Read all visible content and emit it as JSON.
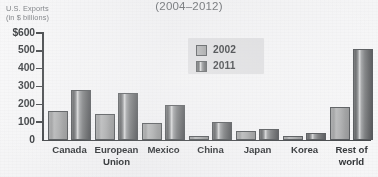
{
  "chart_data": {
    "type": "bar",
    "title": "(2004–2012)",
    "ylabel_line1": "U.S. Exports",
    "ylabel_line2": "(in $ billions)",
    "xlabel": "",
    "ylim": [
      0,
      600
    ],
    "yticks": [
      {
        "value": 600,
        "label": "$600"
      },
      {
        "value": 500,
        "label": "500"
      },
      {
        "value": 400,
        "label": "400"
      },
      {
        "value": 300,
        "label": "300"
      },
      {
        "value": 200,
        "label": "200"
      },
      {
        "value": 100,
        "label": "100"
      },
      {
        "value": 0,
        "label": "0"
      }
    ],
    "grid": false,
    "legend_position": "upper center",
    "categories": [
      "Canada",
      "European Union",
      "Mexico",
      "China",
      "Japan",
      "Korea",
      "Rest of world"
    ],
    "category_lines": [
      [
        "Canada"
      ],
      [
        "European",
        "Union"
      ],
      [
        "Mexico"
      ],
      [
        "China"
      ],
      [
        "Japan"
      ],
      [
        "Korea"
      ],
      [
        "Rest of",
        "world"
      ]
    ],
    "series": [
      {
        "name": "2002",
        "color": "#a6a7a8",
        "values": [
          160,
          145,
          97,
          20,
          50,
          20,
          183
        ]
      },
      {
        "name": "2011",
        "color": "#66686a",
        "values": [
          280,
          265,
          197,
          103,
          63,
          38,
          512
        ]
      }
    ]
  },
  "colors": {
    "background": "#eeeef0",
    "axis": "#3c3f42",
    "tick_text": "#323538",
    "title_text": "#6c6f73",
    "caption_text": "#7a7d81",
    "legend_background": "#d5d6d8",
    "series_2002": "#a6a7a8",
    "series_2011": "#66686a"
  }
}
